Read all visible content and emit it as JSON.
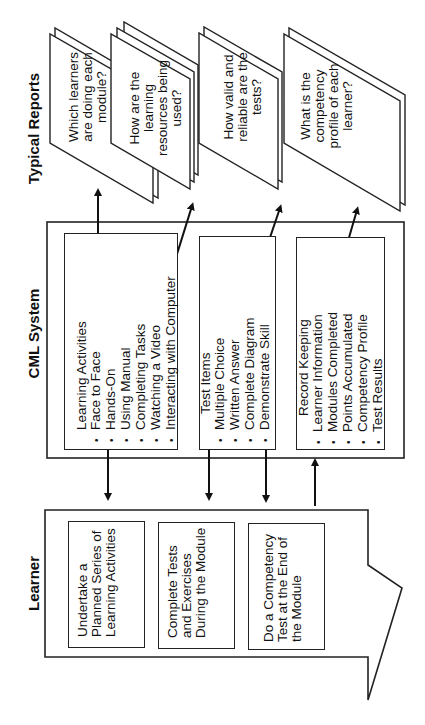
{
  "columns": {
    "learner": {
      "title": "Learner",
      "steps": [
        "Undertake a Planned Series of Learning Activities",
        "Complete Tests and Exercises During the Module",
        "Do a Competency Test at the End of the Module"
      ]
    },
    "cml_system": {
      "title": "CML System",
      "groups": [
        {
          "heading": "Learning Activities",
          "items": [
            "Face to Face",
            "Hands-On",
            "Using Manual",
            "Completing Tasks",
            "Watching a Video",
            "Interacting with Computer"
          ]
        },
        {
          "heading": "Test Items",
          "items": [
            "Multiple Choice",
            "Written Answer",
            "Complete Diagram",
            "Demonstrate Skill"
          ]
        },
        {
          "heading": "Record Keeping",
          "items": [
            "Learner Information",
            "Modules Completed",
            "Points Accumulated",
            "Competency Profile",
            "Test Results"
          ]
        }
      ]
    },
    "typical_reports": {
      "title": "Typical Reports",
      "reports": [
        "Which learners are doing each module?",
        "How are the learning resources being used?",
        "How valid and reliable are the tests?",
        "What is the competency profile of each learner?"
      ]
    }
  },
  "connectors": {
    "learner_to_cml_down": 3,
    "cml_to_learner_up": 1,
    "cml_to_reports": 4
  },
  "colors": {
    "line": "#222222",
    "background": "#ffffff"
  }
}
